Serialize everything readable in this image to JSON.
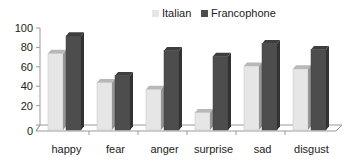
{
  "chart_data": {
    "type": "bar",
    "title": "",
    "xlabel": "",
    "ylabel": "",
    "ylim": [
      0,
      100
    ],
    "yticks": [
      0,
      20,
      40,
      60,
      80,
      100
    ],
    "categories": [
      "happy",
      "fear",
      "anger",
      "surprise",
      "sad",
      "disgust"
    ],
    "series": [
      {
        "name": "Italian",
        "values": [
          80,
          50,
          43,
          19,
          67,
          64
        ],
        "color": "#e6e6e6"
      },
      {
        "name": "Francophone",
        "values": [
          98,
          57,
          83,
          77,
          90,
          84
        ],
        "color": "#4d4d4d"
      }
    ],
    "legend_position": "top",
    "grid": false,
    "style": "3d-clustered-column"
  },
  "legend": {
    "items": [
      {
        "label": "Italian",
        "color": "#e6e6e6"
      },
      {
        "label": "Francophone",
        "color": "#4d4d4d"
      }
    ]
  }
}
